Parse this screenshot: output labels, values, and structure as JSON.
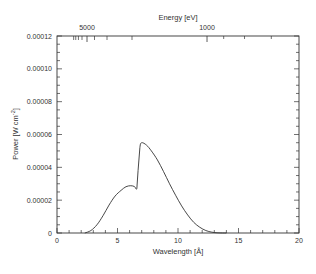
{
  "chart_data": {
    "type": "line",
    "title": "",
    "xlabel": "Wavelength [Å]",
    "ylabel": "Power [W cm-2]",
    "ylabel_parts": {
      "main": "Power [W cm",
      "sup": "-2",
      "end": "]"
    },
    "top_xlabel": "Energy [eV]",
    "xlim": [
      0,
      20
    ],
    "ylim": [
      0,
      0.00012
    ],
    "grid": false,
    "legend": null,
    "x_ticks": [
      0,
      5,
      10,
      15,
      20
    ],
    "x_tick_labels": [
      "0",
      "5",
      "10",
      "15",
      "20"
    ],
    "y_ticks": [
      0,
      2e-05,
      4e-05,
      6e-05,
      8e-05,
      0.0001,
      0.00012
    ],
    "y_tick_labels": [
      "0",
      "0.00002",
      "0.00004",
      "0.00006",
      "0.00008",
      "0.00010",
      "0.00012"
    ],
    "top_axis": {
      "labeled_ticks_eV": [
        5000,
        1000
      ],
      "labeled_tick_text": [
        "5000",
        "1000"
      ],
      "minor_ticks_eV": [
        9000,
        8000,
        7000,
        6000,
        4000,
        3000,
        2000
      ],
      "conversion": "E[eV] = 12398 / wavelength[Å]"
    },
    "series": [
      {
        "name": "Power",
        "color": "#333333",
        "x": [
          2.3,
          2.8,
          3.3,
          3.8,
          4.3,
          4.8,
          5.3,
          5.7,
          6.1,
          6.4,
          6.6,
          6.7,
          6.85,
          7.0,
          7.4,
          7.8,
          8.3,
          8.8,
          9.3,
          9.8,
          10.3,
          10.8,
          11.3,
          11.8,
          12.3,
          12.8,
          13.3,
          14.0
        ],
        "y": [
          0.0,
          1.5e-06,
          5e-06,
          1.05e-05,
          1.7e-05,
          2.25e-05,
          2.6e-05,
          2.82e-05,
          2.88e-05,
          2.83e-05,
          2.72e-05,
          3.8e-05,
          5.2e-05,
          5.5e-05,
          5.35e-05,
          5e-05,
          4.45e-05,
          3.75e-05,
          3e-05,
          2.3e-05,
          1.65e-05,
          1.1e-05,
          6.5e-06,
          3.5e-06,
          1.5e-06,
          5e-07,
          1e-07,
          0.0
        ]
      }
    ]
  }
}
